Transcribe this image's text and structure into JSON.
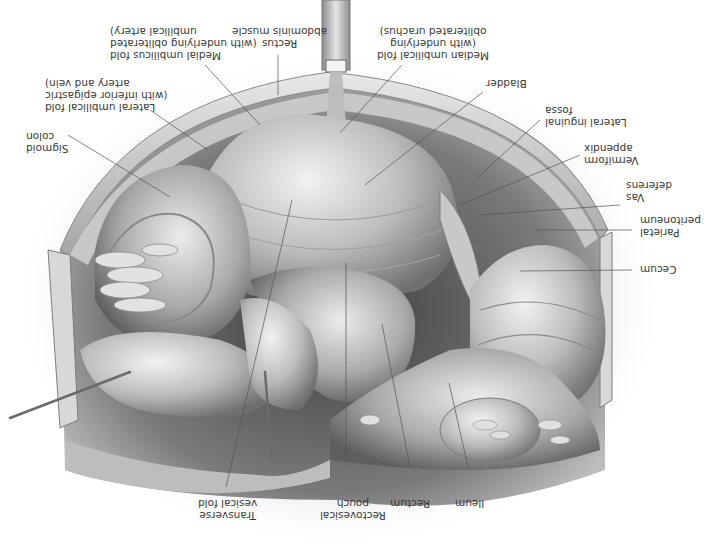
{
  "figure": {
    "orientation": "rotated 180 degrees",
    "palette": {
      "background": "#ffffff",
      "tissue_light": "#d9d9d9",
      "tissue_mid": "#a8a8a8",
      "tissue_dark": "#4a4a4a",
      "leader_line": "#555555",
      "label_text": "#3a3a3a"
    }
  },
  "labels": [
    {
      "id": "rectus",
      "lines": [
        "Rectus",
        "abdominis muscle"
      ]
    },
    {
      "id": "medial-umbilical-fold",
      "lines": [
        "Medial umbilicus fold",
        "(with underlying obliterated",
        "umbilical artery)"
      ]
    },
    {
      "id": "lateral-umbilical-fold",
      "lines": [
        "Lateral umbilical fold",
        "(with inferior epigastric",
        "artery and vein)"
      ]
    },
    {
      "id": "sigmoid-colon",
      "lines": [
        "Sigmoid",
        "colon"
      ]
    },
    {
      "id": "median-umbilical-fold",
      "lines": [
        "Median umbilical fold",
        "(with underlying",
        "obliterated urachus)"
      ]
    },
    {
      "id": "bladder",
      "lines": [
        "Bladder"
      ]
    },
    {
      "id": "lateral-inguinal-fossa",
      "lines": [
        "Lateral inguinal",
        "fossa"
      ]
    },
    {
      "id": "vermiform-appendix",
      "lines": [
        "Vermiform",
        "appendix"
      ]
    },
    {
      "id": "vas-deferens",
      "lines": [
        "Vas",
        "deferens"
      ]
    },
    {
      "id": "parietal-peritoneum",
      "lines": [
        "Parietal",
        "peritoneum"
      ]
    },
    {
      "id": "cecum",
      "lines": [
        "Cecum"
      ]
    },
    {
      "id": "ileum",
      "lines": [
        "Ileum"
      ]
    },
    {
      "id": "rectum",
      "lines": [
        "Rectum"
      ]
    },
    {
      "id": "rectovesical-pouch",
      "lines": [
        "Rectovesical",
        "pouch"
      ]
    },
    {
      "id": "transverse-vesical-fold",
      "lines": [
        "Transverse",
        "vesical fold"
      ]
    }
  ]
}
